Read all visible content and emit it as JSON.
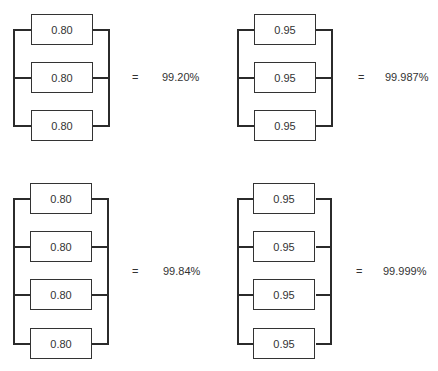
{
  "diagrams": [
    {
      "id": "top-left",
      "components": [
        "0.80",
        "0.80",
        "0.80"
      ],
      "equals": "=",
      "result": "99.20%"
    },
    {
      "id": "top-right",
      "components": [
        "0.95",
        "0.95",
        "0.95"
      ],
      "equals": "=",
      "result": "99.987%"
    },
    {
      "id": "bottom-left",
      "components": [
        "0.80",
        "0.80",
        "0.80",
        "0.80"
      ],
      "equals": "=",
      "result": "99.84%"
    },
    {
      "id": "bottom-right",
      "components": [
        "0.95",
        "0.95",
        "0.95",
        "0.95"
      ],
      "equals": "=",
      "result": "99.999%"
    }
  ]
}
